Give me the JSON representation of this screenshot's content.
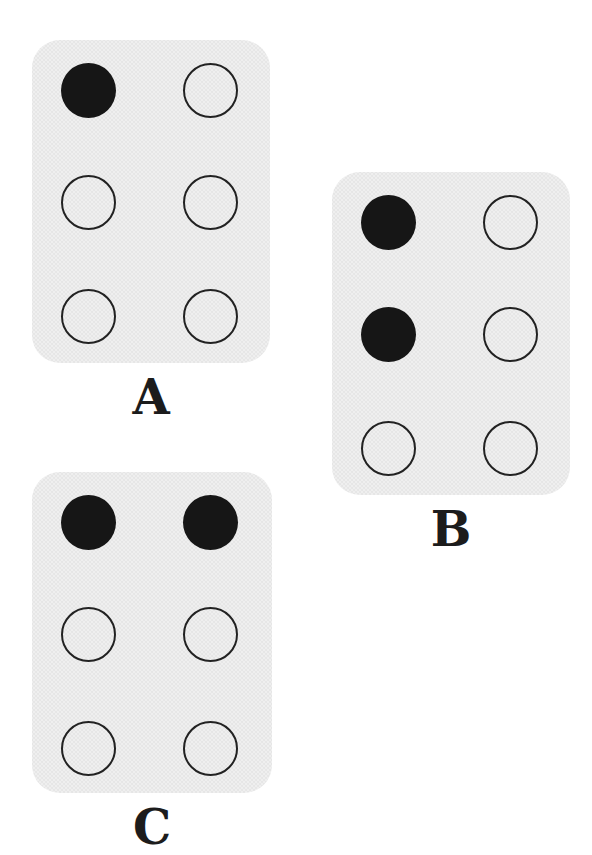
{
  "figure": {
    "rows": 3,
    "columns": 2,
    "dot_diameter_px": 55
  },
  "palette": {
    "page_background": "#ffffff",
    "card_background": "#e2e2e2",
    "card_texture_dot": "#cdcdcd",
    "dot_fill": "#161616",
    "dot_outline": "#222222",
    "label_color": "#1c1c1c"
  },
  "cards": [
    {
      "label": "A",
      "x": 32,
      "y": 40,
      "width": 238,
      "height": 323,
      "filled_count": 1,
      "dots": [
        [
          "filled",
          "open"
        ],
        [
          "open",
          "open"
        ],
        [
          "open",
          "open"
        ]
      ]
    },
    {
      "label": "B",
      "x": 332,
      "y": 172,
      "width": 238,
      "height": 323,
      "filled_count": 2,
      "dots": [
        [
          "filled",
          "open"
        ],
        [
          "filled",
          "open"
        ],
        [
          "open",
          "open"
        ]
      ]
    },
    {
      "label": "C",
      "x": 32,
      "y": 472,
      "width": 240,
      "height": 321,
      "filled_count": 2,
      "dots": [
        [
          "filled",
          "filled"
        ],
        [
          "open",
          "open"
        ],
        [
          "open",
          "open"
        ]
      ]
    }
  ]
}
